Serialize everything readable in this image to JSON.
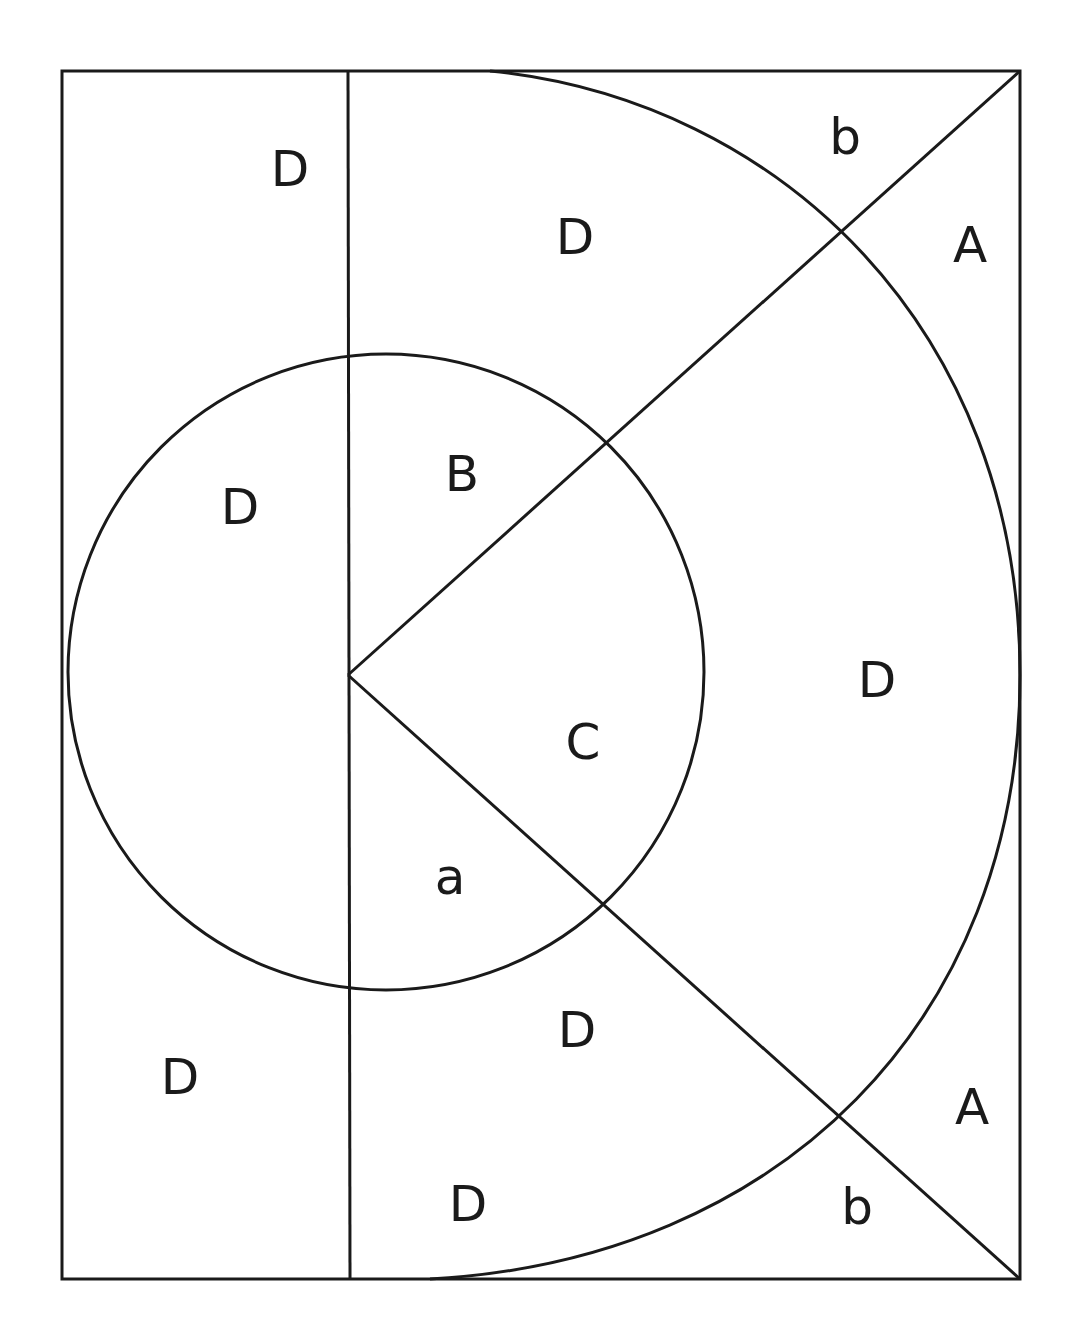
{
  "diagram": {
    "type": "geometric region diagram",
    "stroke_color": "#1a1a1a",
    "background": "#ffffff",
    "labels": [
      {
        "text": "D",
        "x": 290,
        "y": 172
      },
      {
        "text": "D",
        "x": 575,
        "y": 240
      },
      {
        "text": "b",
        "x": 845,
        "y": 140
      },
      {
        "text": "A",
        "x": 970,
        "y": 248
      },
      {
        "text": "D",
        "x": 240,
        "y": 510
      },
      {
        "text": "B",
        "x": 462,
        "y": 477
      },
      {
        "text": "D",
        "x": 877,
        "y": 683
      },
      {
        "text": "C",
        "x": 583,
        "y": 745
      },
      {
        "text": "a",
        "x": 450,
        "y": 880
      },
      {
        "text": "D",
        "x": 577,
        "y": 1033
      },
      {
        "text": "D",
        "x": 180,
        "y": 1080
      },
      {
        "text": "A",
        "x": 972,
        "y": 1110
      },
      {
        "text": "D",
        "x": 468,
        "y": 1207
      },
      {
        "text": "b",
        "x": 857,
        "y": 1210
      }
    ]
  }
}
